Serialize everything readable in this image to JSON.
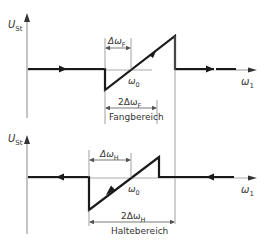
{
  "diagrams": [
    {
      "id": "capture-range",
      "y_axis_label": "U",
      "y_axis_sub": "St",
      "x_axis_label": "ω",
      "x_axis_sub": "1",
      "center_label": "ω",
      "center_sub": "0",
      "delta_label": "Δω",
      "delta_sub": "F",
      "double_delta_label": "2Δω",
      "double_delta_sub": "F",
      "range_name": "Fangbereich"
    },
    {
      "id": "hold-range",
      "y_axis_label": "U",
      "y_axis_sub": "St",
      "x_axis_label": "ω",
      "x_axis_sub": "1",
      "center_label": "ω",
      "center_sub": "0",
      "delta_label": "Δω",
      "delta_sub": "H",
      "double_delta_label": "2Δω",
      "double_delta_sub": "H",
      "range_name": "Haltebereich"
    }
  ],
  "colors": {
    "line": "#1a1a1a",
    "axis": "#888888",
    "text": "#333333"
  }
}
